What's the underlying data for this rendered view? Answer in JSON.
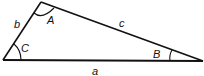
{
  "diagram": {
    "type": "triangle",
    "stroke_color": "#111111",
    "vertices": {
      "A": {
        "x": 41,
        "y": 2
      },
      "B": {
        "x": 203,
        "y": 61
      },
      "C": {
        "x": 3,
        "y": 60
      }
    },
    "sides": {
      "a": {
        "label": "a",
        "from": "C",
        "to": "B"
      },
      "b": {
        "label": "b",
        "from": "C",
        "to": "A"
      },
      "c": {
        "label": "c",
        "from": "A",
        "to": "B"
      }
    },
    "angles": {
      "A": {
        "label": "A"
      },
      "B": {
        "label": "B"
      },
      "C": {
        "label": "C"
      }
    }
  }
}
